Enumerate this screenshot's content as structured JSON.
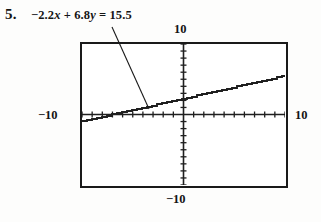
{
  "exercise": {
    "number": "5.",
    "equation_text": "-2.2x + 6.8y = 15.5",
    "equation_lhs_a": "−2.2",
    "equation_var_x": "x",
    "equation_plus": "+",
    "equation_lhs_b": "6.8",
    "equation_var_y": "y",
    "equation_equals": "=",
    "equation_rhs": "15.5"
  },
  "window": {
    "ymax_label": "10",
    "ymin_label": "−10",
    "xmin_label": "−10",
    "xmax_label": "10"
  },
  "colors": {
    "ink": "#1a1a1a",
    "paper": "#fdfdfc",
    "curve": "#1f1f1f"
  },
  "chart_data": {
    "type": "line",
    "xlabel": "",
    "ylabel": "",
    "xlim": [
      -10,
      10
    ],
    "ylim": [
      -10,
      10
    ],
    "xtick_step": 1,
    "ytick_step": 1,
    "grid": false,
    "legend": null,
    "axes_style": "graphing-calculator-standard-window",
    "series": [
      {
        "name": "-2.2x + 6.8y = 15.5",
        "equation": "y = (15.5 + 2.2x) / 6.8",
        "slope": 0.3235,
        "intercept": 2.2794,
        "x_intercept": -7.0455,
        "rendered_as": "stair-stepped pixel line",
        "x": [
          -10,
          -8,
          -6,
          -4,
          -2,
          0,
          2,
          4,
          6,
          8,
          10
        ],
        "y": [
          -0.956,
          -0.309,
          0.338,
          0.985,
          1.632,
          2.279,
          2.926,
          3.574,
          4.221,
          4.868,
          5.515
        ]
      }
    ],
    "annotations": [
      {
        "text": "-2.2x + 6.8y = 15.5",
        "points_to_x": -3.3,
        "points_to_y": 1.2,
        "style": "leader-line"
      }
    ]
  }
}
